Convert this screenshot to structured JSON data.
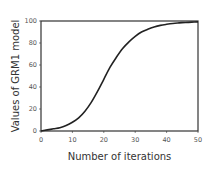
{
  "chart_data": {
    "type": "line",
    "title": "",
    "xlabel": "Number of iterations",
    "ylabel": "Values of GRM1 model",
    "xlim": [
      0,
      50
    ],
    "ylim": [
      0,
      100
    ],
    "xticks": [
      0,
      10,
      20,
      30,
      40,
      50
    ],
    "yticks": [
      0,
      20,
      40,
      60,
      80,
      100
    ],
    "grid": false,
    "legend": null,
    "series": [
      {
        "name": "GRM1 model",
        "color": "#222222",
        "x": [
          0,
          2,
          4,
          6,
          8,
          10,
          12,
          14,
          16,
          18,
          20,
          22,
          24,
          26,
          28,
          30,
          32,
          34,
          36,
          38,
          40,
          42,
          44,
          46,
          48,
          50
        ],
        "y": [
          0,
          1,
          2,
          3,
          5,
          8,
          12,
          18,
          26,
          36,
          47,
          58,
          67,
          75,
          81,
          86,
          90,
          92.5,
          94.5,
          96,
          97,
          97.8,
          98.3,
          98.7,
          99,
          99.2
        ]
      }
    ]
  },
  "colors": {
    "axis": "#333333",
    "line": "#222222",
    "tick_text": "#555555",
    "title_text": "#333333",
    "background": "#ffffff"
  }
}
